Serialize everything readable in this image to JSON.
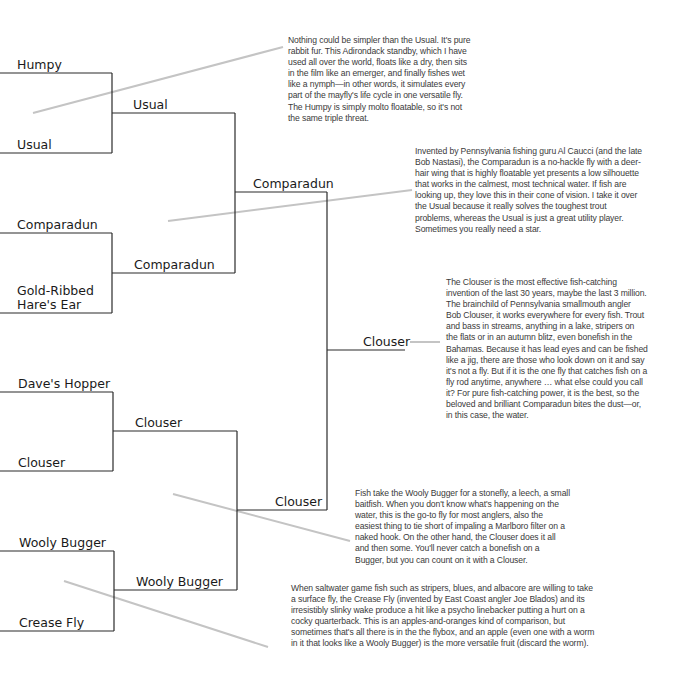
{
  "bracket": {
    "round1": [
      {
        "label": "Humpy"
      },
      {
        "label": "Usual"
      },
      {
        "label": "Comparadun"
      },
      {
        "label": "Gold-Ribbed Hare's Ear"
      },
      {
        "label": "Dave's Hopper"
      },
      {
        "label": "Clouser"
      },
      {
        "label": "Wooly Bugger"
      },
      {
        "label": "Crease Fly"
      }
    ],
    "round2": [
      {
        "label": "Usual"
      },
      {
        "label": "Comparadun"
      },
      {
        "label": "Clouser"
      },
      {
        "label": "Wooly Bugger"
      }
    ],
    "round3": [
      {
        "label": "Comparadun"
      },
      {
        "label": "Clouser"
      }
    ],
    "final": {
      "label": "Clouser"
    }
  },
  "commentary": [
    {
      "target": "Usual",
      "text": "Nothing could be simpler than the Usual. It's pure rabbit fur. This Adirondack standby, which I have used all over the world, floats like a dry, then sits in the film like an emerger, and finally fishes wet like a nymph—in other words, it simulates every part of the mayfly's life cycle in one versatile fly. The Humpy is simply molto floatable, so it's not the same triple threat."
    },
    {
      "target": "Comparadun",
      "text": "Invented by Pennsylvania fishing guru Al Caucci (and the late Bob Nastasi), the Comparadun is a no-hackle fly with a deer-hair wing that is highly floatable yet presents a low silhouette that works in the calmest, most technical water. If fish are looking up, they love this in their cone of vision. I take it over the Usual because it really solves the toughest trout problems, whereas the Usual is just a great utility player. Sometimes you really need a star."
    },
    {
      "target": "Clouser (final)",
      "text": "The Clouser is the most effective fish-catching invention of the last 30 years, maybe the last 3 million. The brainchild of Pennsylvania smallmouth angler Bob Clouser, it works everywhere for every fish. Trout and bass in streams, anything in a lake, stripers on the flats or in an autumn blitz, even bonefish in the Bahamas. Because it has lead eyes and can be fished like a jig, there are those who look down on it and say it's not a fly. But if it is the one fly that catches fish on a fly rod anytime, anywhere … what else could you call it? For pure fish-catching power, it is the best, so the beloved and brilliant Comparadun bites the dust—or, in this case, the water."
    },
    {
      "target": "Clouser",
      "text": "Fish take the Wooly Bugger for a stonefly, a leech, a small baitfish. When you don't know what's happening on the water, this is the go-to fly for most anglers, also the easiest thing to tie short of impaling a Marlboro filter on a naked hook. On the other hand, the Clouser does it all and then some. You'll never catch a bonefish on a Bugger, but you can count on it with a Clouser."
    },
    {
      "target": "Wooly Bugger",
      "text": "When saltwater game fish such as stripers, blues, and albacore are willing to take a surface fly, the Crease Fly (invented by East Coast angler Joe Blados) and its irresistibly slinky wake produce a hit like a psycho linebacker putting a hurt on a cocky quarterback. This is an apples-and-oranges kind of comparison, but sometimes that's all there is in the the flybox, and an apple (even one with a worm in it that looks like a Wooly Bugger) is the more versatile fruit (discard the worm)."
    }
  ],
  "colors": {
    "bracket_line": "#2a2a2a",
    "connector_line": "#bdbdbd",
    "text": "#1a1a1a",
    "commentary_text": "#3a3a3a"
  }
}
